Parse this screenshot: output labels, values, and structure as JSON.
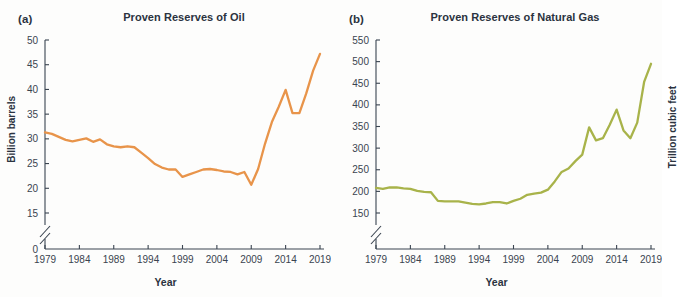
{
  "figure": {
    "background": "#fdfdfc",
    "panels": [
      {
        "letter": "(a)",
        "title": "Proven Reserves of Oil",
        "xlabel": "Year",
        "ylabel": "Billion barrels"
      },
      {
        "letter": "(b)",
        "title": "Proven Reserves of Natural Gas",
        "xlabel": "Year",
        "ylabel": "Trillion cubic feet"
      }
    ]
  },
  "chart_data": [
    {
      "type": "line",
      "title": "Proven Reserves of Oil",
      "panel": "(a)",
      "xlabel": "Year",
      "ylabel": "Billion barrels",
      "line_color": "#e8944a",
      "grid": false,
      "legend": null,
      "xlim": [
        1979,
        2019
      ],
      "ylim": [
        15,
        50
      ],
      "y_axis_break": true,
      "y_break_between": [
        0,
        15
      ],
      "xticks": [
        1979,
        1984,
        1989,
        1994,
        1999,
        2004,
        2009,
        2014,
        2019
      ],
      "yticks": [
        0,
        15,
        20,
        25,
        30,
        35,
        40,
        45,
        50
      ],
      "x": [
        1979,
        1980,
        1981,
        1982,
        1983,
        1984,
        1985,
        1986,
        1987,
        1988,
        1989,
        1990,
        1991,
        1992,
        1993,
        1994,
        1995,
        1996,
        1997,
        1998,
        1999,
        2000,
        2001,
        2002,
        2003,
        2004,
        2005,
        2006,
        2007,
        2008,
        2009,
        2010,
        2011,
        2012,
        2013,
        2014,
        2015,
        2016,
        2017,
        2018,
        2019
      ],
      "values": [
        31.3,
        31.0,
        30.4,
        29.8,
        29.5,
        29.8,
        30.1,
        29.4,
        29.9,
        28.9,
        28.5,
        28.3,
        28.5,
        28.3,
        27.2,
        26.1,
        24.9,
        24.2,
        23.8,
        23.8,
        22.3,
        22.8,
        23.3,
        23.8,
        23.9,
        23.7,
        23.4,
        23.3,
        22.8,
        23.3,
        20.7,
        23.9,
        29.0,
        33.4,
        36.5,
        39.9,
        35.2,
        35.2,
        39.2,
        43.8,
        47.2
      ]
    },
    {
      "type": "line",
      "title": "Proven Reserves of Natural Gas",
      "panel": "(b)",
      "xlabel": "Year",
      "ylabel": "Trillion cubic feet",
      "line_color": "#a8b34a",
      "grid": false,
      "legend": null,
      "xlim": [
        1979,
        2019
      ],
      "ylim": [
        150,
        550
      ],
      "y_axis_break": true,
      "y_break_below": 150,
      "xticks": [
        1979,
        1984,
        1989,
        1994,
        1999,
        2004,
        2009,
        2014,
        2019
      ],
      "yticks": [
        150,
        200,
        250,
        300,
        350,
        400,
        450,
        500,
        550
      ],
      "x": [
        1979,
        1980,
        1981,
        1982,
        1983,
        1984,
        1985,
        1986,
        1987,
        1988,
        1989,
        1990,
        1991,
        1992,
        1993,
        1994,
        1995,
        1996,
        1997,
        1998,
        1999,
        2000,
        2001,
        2002,
        2003,
        2004,
        2005,
        2006,
        2007,
        2008,
        2009,
        2010,
        2011,
        2012,
        2013,
        2014,
        2015,
        2016,
        2017,
        2018,
        2019
      ],
      "values": [
        208,
        206,
        209,
        209,
        207,
        206,
        201,
        199,
        198,
        178,
        177,
        177,
        177,
        174,
        171,
        170,
        172,
        175,
        175,
        172,
        178,
        183,
        192,
        195,
        197,
        204,
        223,
        245,
        253,
        270,
        285,
        348,
        318,
        323,
        354,
        389,
        341,
        323,
        359,
        453,
        495
      ]
    }
  ]
}
